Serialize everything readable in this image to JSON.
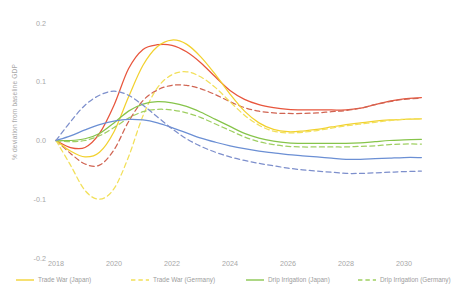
{
  "chart_data": {
    "type": "line",
    "title": "",
    "xlabel": "",
    "ylabel": "% deviation from baseline GDP",
    "xlim": [
      2018,
      2031
    ],
    "ylim": [
      -0.2,
      0.2
    ],
    "grid": false,
    "legend_position": "bottom",
    "x_tick_labels": [
      "2018",
      "2020",
      "2022",
      "2024",
      "2026",
      "2028",
      "2030"
    ],
    "x_ticks": [
      2018,
      2020,
      2022,
      2024,
      2026,
      2028,
      2030
    ],
    "y_tick_labels": [
      "0.2",
      "0.1",
      "0.0",
      "-0.1",
      "-0.2"
    ],
    "y_ticks": [
      0.2,
      0.1,
      0.0,
      -0.1,
      -0.2
    ],
    "x": [
      2018,
      2018.5,
      2019,
      2019.5,
      2020,
      2020.5,
      2021,
      2021.5,
      2022,
      2022.5,
      2023,
      2023.5,
      2024,
      2024.5,
      2025,
      2025.5,
      2026,
      2026.5,
      2027,
      2027.5,
      2028,
      2028.5,
      2029,
      2029.5,
      2030,
      2030.6
    ],
    "series": [
      {
        "name": "Trade War (Japan) - red solid",
        "color": "#e8553c",
        "style": "solid",
        "values": [
          0.0,
          -0.012,
          -0.012,
          0.012,
          0.06,
          0.122,
          0.155,
          0.163,
          0.162,
          0.151,
          0.132,
          0.108,
          0.085,
          0.07,
          0.061,
          0.056,
          0.053,
          0.052,
          0.052,
          0.052,
          0.052,
          0.055,
          0.061,
          0.067,
          0.071,
          0.073
        ]
      },
      {
        "name": "Trade War (Germany) - red dashed",
        "color": "#d06452",
        "style": "dashed",
        "values": [
          0.0,
          -0.022,
          -0.04,
          -0.042,
          -0.016,
          0.032,
          0.068,
          0.086,
          0.094,
          0.094,
          0.088,
          0.078,
          0.066,
          0.056,
          0.05,
          0.047,
          0.046,
          0.046,
          0.047,
          0.049,
          0.051,
          0.055,
          0.061,
          0.066,
          0.07,
          0.072
        ]
      },
      {
        "name": "Trade War (Japan) - yellow solid",
        "color": "#f2d12e",
        "style": "solid",
        "values": [
          0.0,
          -0.018,
          -0.028,
          -0.02,
          0.015,
          0.074,
          0.128,
          0.16,
          0.171,
          0.164,
          0.142,
          0.112,
          0.079,
          0.05,
          0.03,
          0.019,
          0.015,
          0.016,
          0.019,
          0.023,
          0.027,
          0.03,
          0.033,
          0.035,
          0.036,
          0.037
        ]
      },
      {
        "name": "Trade War (Germany) - yellow dashed",
        "color": "#f2e05a",
        "style": "dashed",
        "values": [
          0.0,
          -0.042,
          -0.085,
          -0.1,
          -0.082,
          -0.028,
          0.042,
          0.09,
          0.112,
          0.117,
          0.108,
          0.09,
          0.066,
          0.043,
          0.026,
          0.016,
          0.013,
          0.014,
          0.017,
          0.021,
          0.025,
          0.028,
          0.031,
          0.034,
          0.036,
          0.037
        ]
      },
      {
        "name": "Drip Irrigation (Japan) - green solid",
        "color": "#86c44a",
        "style": "solid",
        "values": [
          0.0,
          0.0,
          0.003,
          0.012,
          0.03,
          0.05,
          0.062,
          0.066,
          0.064,
          0.058,
          0.048,
          0.036,
          0.024,
          0.012,
          0.004,
          -0.001,
          -0.004,
          -0.005,
          -0.005,
          -0.005,
          -0.005,
          -0.004,
          -0.002,
          0.0,
          0.001,
          0.002
        ]
      },
      {
        "name": "Drip Irrigation (Germany) - green dashed",
        "color": "#9fcf62",
        "style": "dashed",
        "values": [
          0.0,
          -0.002,
          0.0,
          0.008,
          0.022,
          0.038,
          0.049,
          0.053,
          0.052,
          0.047,
          0.039,
          0.028,
          0.017,
          0.006,
          -0.002,
          -0.007,
          -0.01,
          -0.011,
          -0.011,
          -0.011,
          -0.011,
          -0.01,
          -0.009,
          -0.007,
          -0.006,
          -0.006
        ]
      },
      {
        "name": "Drip Irrigation (Japan) - blue solid",
        "color": "#6b8fd4",
        "style": "solid",
        "values": [
          0.0,
          0.008,
          0.018,
          0.027,
          0.033,
          0.036,
          0.035,
          0.03,
          0.022,
          0.013,
          0.004,
          -0.003,
          -0.009,
          -0.014,
          -0.018,
          -0.021,
          -0.024,
          -0.026,
          -0.028,
          -0.03,
          -0.032,
          -0.032,
          -0.031,
          -0.03,
          -0.029,
          -0.029
        ]
      },
      {
        "name": "Drip Irrigation (Germany) - blue dashed",
        "color": "#7d8fcc",
        "style": "dashed",
        "values": [
          0.0,
          0.032,
          0.06,
          0.077,
          0.084,
          0.077,
          0.06,
          0.04,
          0.02,
          0.003,
          -0.01,
          -0.02,
          -0.028,
          -0.034,
          -0.039,
          -0.043,
          -0.047,
          -0.05,
          -0.052,
          -0.054,
          -0.056,
          -0.056,
          -0.055,
          -0.054,
          -0.053,
          -0.052
        ]
      }
    ],
    "legend": [
      {
        "label": "Trade War (Japan)",
        "color": "#f2d12e",
        "style": "solid"
      },
      {
        "label": "Trade War (Germany)",
        "color": "#f2e05a",
        "style": "dashed"
      },
      {
        "label": "Drip Irrigation (Japan)",
        "color": "#86c44a",
        "style": "solid"
      },
      {
        "label": "Drip Irrigation (Germany)",
        "color": "#9fcf62",
        "style": "dashed"
      }
    ]
  }
}
